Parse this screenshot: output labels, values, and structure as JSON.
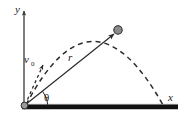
{
  "figure": {
    "kind": "projectile-motion-diagram",
    "background_color": "#ffffff",
    "stroke_color": "#2b2b2b",
    "ground_color": "#111111",
    "particle_fill": "#8c8c8c",
    "width": 187,
    "height": 124
  },
  "labels": {
    "y_axis": "y",
    "x_axis": "x",
    "velocity": "v",
    "velocity_subscript": "0",
    "radius": "r",
    "angle": "θ"
  },
  "geometry": {
    "origin": {
      "x": 24,
      "y": 106
    },
    "y_axis_top": {
      "x": 24,
      "y": 9
    },
    "ground_start": {
      "x": 22,
      "y": 107
    },
    "ground_end": {
      "x": 178,
      "y": 107
    },
    "velocity_arrow_tip": {
      "x": 44,
      "y": 62
    },
    "radius_arrow_tip": {
      "x": 116,
      "y": 32
    },
    "particle": {
      "x": 118,
      "y": 30,
      "radius": 4
    },
    "trajectory_apex": {
      "x": 92,
      "y": 16
    },
    "trajectory_landing": {
      "x": 163,
      "y": 106
    },
    "angle_arc_radius": 24
  },
  "styles": {
    "trajectory_dash": "5,4",
    "velocity_dash": "3,3",
    "ground_thickness": 5
  }
}
